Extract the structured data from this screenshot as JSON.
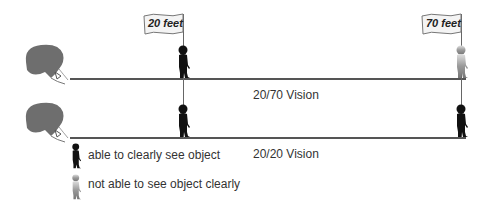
{
  "diagram": {
    "flags": [
      {
        "label": "20 feet"
      },
      {
        "label": "70 feet"
      }
    ],
    "rows": [
      {
        "caption": "20/70 Vision"
      },
      {
        "caption": "20/20 Vision"
      }
    ],
    "legend": [
      {
        "icon": "dark-child-silhouette",
        "label": "able to clearly see object"
      },
      {
        "icon": "faded-child-silhouette",
        "label": "not able to see object clearly"
      }
    ],
    "colors": {
      "hair": "#6e6e6e",
      "line": "#555555",
      "clear_figure": "#111111",
      "blurry_figure": "#9a9a9a"
    }
  }
}
